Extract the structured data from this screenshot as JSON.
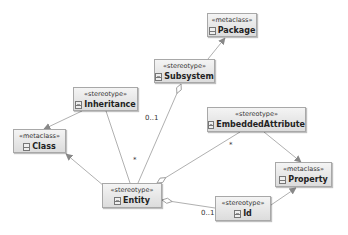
{
  "diagram": {
    "type": "UML profile diagram",
    "nodes": [
      {
        "id": "package",
        "stereotype": "«metaclass»",
        "name": "Package",
        "kind": "metaclass",
        "x": 207,
        "y": 13,
        "w": 50,
        "h": 24
      },
      {
        "id": "subsystem",
        "stereotype": "«stereotype»",
        "name": "Subsystem",
        "kind": "stereotype",
        "x": 154,
        "y": 59,
        "w": 61,
        "h": 24
      },
      {
        "id": "inheritance",
        "stereotype": "«stereotype»",
        "name": "Inheritance",
        "kind": "stereotype",
        "x": 73,
        "y": 87,
        "w": 65,
        "h": 24
      },
      {
        "id": "class",
        "stereotype": "«metaclass»",
        "name": "Class",
        "kind": "metaclass",
        "x": 13,
        "y": 129,
        "w": 53,
        "h": 24
      },
      {
        "id": "embeddedattribute",
        "stereotype": "«stereotype»",
        "name": "EmbeddedAttribute",
        "kind": "stereotype",
        "x": 207,
        "y": 107,
        "w": 99,
        "h": 25
      },
      {
        "id": "property",
        "stereotype": "«metaclass»",
        "name": "Property",
        "kind": "metaclass",
        "x": 275,
        "y": 162,
        "w": 57,
        "h": 25
      },
      {
        "id": "entity",
        "stereotype": "«stereotype»",
        "name": "Entity",
        "kind": "stereotype",
        "x": 102,
        "y": 183,
        "w": 60,
        "h": 25
      },
      {
        "id": "id",
        "stereotype": "«stereotype»",
        "name": "Id",
        "kind": "stereotype",
        "x": 215,
        "y": 196,
        "w": 56,
        "h": 25
      }
    ],
    "edges": [
      {
        "from": "subsystem",
        "to": "package",
        "type": "extension"
      },
      {
        "from": "inheritance",
        "to": "class",
        "type": "extension"
      },
      {
        "from": "entity",
        "to": "class",
        "type": "extension"
      },
      {
        "from": "embeddedattribute",
        "to": "property",
        "type": "extension"
      },
      {
        "from": "id",
        "to": "property",
        "type": "extension"
      },
      {
        "from": "subsystem",
        "to": "entity",
        "type": "aggregation",
        "target_multiplicity": "*"
      },
      {
        "from": "entity",
        "to": "inheritance",
        "type": "association",
        "target_multiplicity": "0..1"
      },
      {
        "from": "entity",
        "to": "embeddedattribute",
        "type": "aggregation",
        "target_multiplicity": "*"
      },
      {
        "from": "entity",
        "to": "id",
        "type": "aggregation",
        "target_multiplicity": "0..1"
      }
    ],
    "multiplicity_labels": [
      {
        "text": "0..1",
        "x": 145,
        "y": 119
      },
      {
        "text": "*",
        "x": 133,
        "y": 160
      },
      {
        "text": "*",
        "x": 230,
        "y": 145
      },
      {
        "text": "0..1",
        "x": 201,
        "y": 213
      }
    ]
  },
  "colors": {
    "edge": "#a8a8a8",
    "node_border": "#a8a8a8",
    "node_fill_top": "#f4f4f4",
    "node_fill_bottom": "#dcdcdc"
  }
}
